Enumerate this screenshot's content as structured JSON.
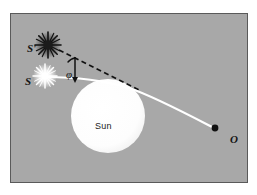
{
  "figure": {
    "background_color": "#ffffff",
    "panel_color": "#a8a8a8",
    "panel_border_color": "#5a5a5a"
  },
  "labels": {
    "source_apparent": "S'",
    "source_true": "S",
    "observer": "O",
    "deflection_angle": "φ",
    "sun": "Sun"
  },
  "colors": {
    "sun_fill": "#fdfdfd",
    "light_ray": "#ffffff",
    "apparent_ray": "#111111",
    "observer_dot": "#111111",
    "star_true": "#ffffff",
    "star_apparent": "#1b1b1b",
    "text": "#141414"
  },
  "elements": {
    "sun": {
      "cx": 97,
      "cy": 102,
      "r": 37
    },
    "star_true": {
      "cx": 34,
      "cy": 62,
      "r": 11
    },
    "star_apparent": {
      "cx": 37,
      "cy": 31,
      "r": 12
    },
    "observer_dot": {
      "cx": 204,
      "cy": 114,
      "r": 3
    }
  },
  "geometry": {
    "light_ray_description": "Curved solid white ray from S bending around the upper limb of the Sun toward observer O",
    "apparent_ray_description": "Straight black dashed line of sight from observer back to apparent position S'",
    "angle_description": "Angle phi between the true ray direction and the apparent line of sight"
  }
}
